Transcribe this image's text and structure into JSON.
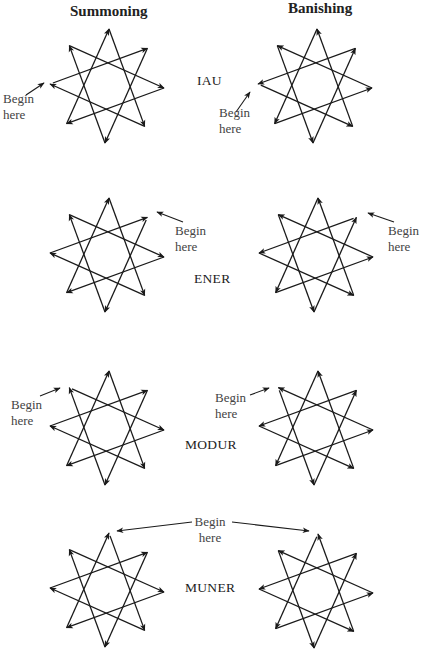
{
  "headers": {
    "summoning": "Summoning",
    "banishing": "Banishing"
  },
  "begin_label": {
    "line1": "Begin",
    "line2": "here"
  },
  "colors": {
    "background": "#ffffff",
    "stroke": "#1a1a1a",
    "text": "#333333"
  },
  "star": {
    "type": "octagram {8/3}",
    "radius": 57,
    "vertex_order": [
      "top",
      "upper-right",
      "right",
      "lower-right",
      "bottom",
      "lower-left",
      "left",
      "upper-left"
    ]
  },
  "rows": [
    {
      "name": "IAU",
      "start_vertex": "left",
      "summoning": {
        "cx": 107,
        "cy": 86,
        "direction": "clockwise"
      },
      "banishing": {
        "cx": 315,
        "cy": 86,
        "direction": "counterclockwise"
      }
    },
    {
      "name": "ENER",
      "start_vertex": "upper-right",
      "summoning": {
        "cx": 107,
        "cy": 255,
        "direction": "clockwise"
      },
      "banishing": {
        "cx": 316,
        "cy": 255,
        "direction": "counterclockwise"
      }
    },
    {
      "name": "MODUR",
      "start_vertex": "upper-left",
      "summoning": {
        "cx": 107,
        "cy": 428,
        "direction": "clockwise"
      },
      "banishing": {
        "cx": 316,
        "cy": 428,
        "direction": "counterclockwise"
      }
    },
    {
      "name": "MUNER",
      "start_vertex": "top",
      "summoning": {
        "cx": 107,
        "cy": 590,
        "direction": "clockwise"
      },
      "banishing": {
        "cx": 316,
        "cy": 591,
        "direction": "counterclockwise"
      }
    }
  ]
}
